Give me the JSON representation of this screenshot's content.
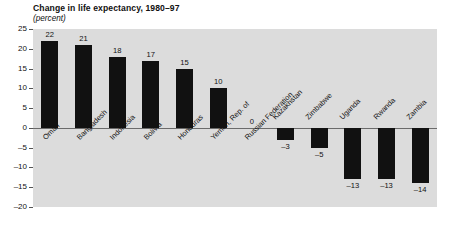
{
  "chart_data": {
    "type": "bar",
    "title": "Change in life expectancy, 1980–97",
    "subtitle": "(percent)",
    "xlabel": "",
    "ylabel": "",
    "ylim": [
      -20,
      25
    ],
    "yticks": [
      25,
      20,
      15,
      10,
      5,
      0,
      -5,
      -10,
      -15,
      -20
    ],
    "ytick_labels": [
      "25",
      "20",
      "15",
      "10",
      "5",
      "0",
      "–5",
      "–10",
      "–15",
      "–20"
    ],
    "grid": false,
    "legend": "none",
    "bar_color": "#111111",
    "plot_background": "#dcdcdc",
    "page_background": "#ffffff",
    "categories": [
      "Oman",
      "Bangladesh",
      "Indonesia",
      "Bolivia",
      "Honduras",
      "Yemen, Rep. of",
      "Russian Federation",
      "Kazakhstan",
      "Zimbabwe",
      "Uganda",
      "Rwanda",
      "Zambia"
    ],
    "values": [
      22,
      21,
      18,
      17,
      15,
      10,
      0,
      -3,
      -5,
      -13,
      -13,
      -14
    ],
    "value_labels": [
      "22",
      "21",
      "18",
      "17",
      "15",
      "10",
      "0",
      "–3",
      "–5",
      "–13",
      "–13",
      "–14"
    ]
  },
  "source": {
    "text": ""
  }
}
